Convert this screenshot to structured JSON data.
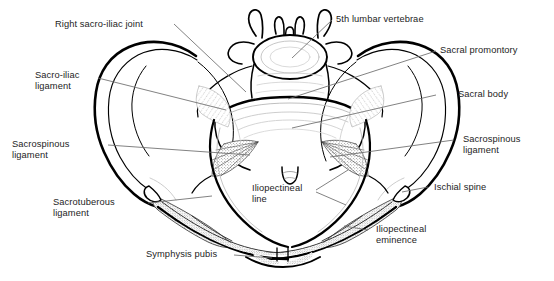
{
  "figure": {
    "background_color": "#ffffff",
    "outline_color": "#000000",
    "text_color": "#242424",
    "leader_line_color": "#6b6b6b"
  },
  "labels": {
    "right_sacro_iliac_joint": "Right sacro-iliac joint",
    "sacro_iliac_ligament_line1": "Sacro-iliac",
    "sacro_iliac_ligament_line2": "ligament",
    "sacrospinous_ligament_left_line1": "Sacrospinous",
    "sacrospinous_ligament_left_line2": "ligament",
    "sacrotuberous_ligament_line1": "Sacrotuberous",
    "sacrotuberous_ligament_line2": "ligament",
    "symphysis_pubis": "Symphysis pubis",
    "fifth_lumbar_vertebrae": "5th lumbar vertebrae",
    "sacral_promontory": "Sacral promontory",
    "sacral_body": "Sacral body",
    "sacrospinous_ligament_right_line1": "Sacrospinous",
    "sacrospinous_ligament_right_line2": "ligament",
    "ischial_spine": "Ischial spine",
    "iliopectineal_eminence_line1": "Iliopectineal",
    "iliopectineal_eminence_line2": "eminence",
    "iliopectineal_line_line1": "Iliopectineal",
    "iliopectineal_line_line2": "line"
  }
}
